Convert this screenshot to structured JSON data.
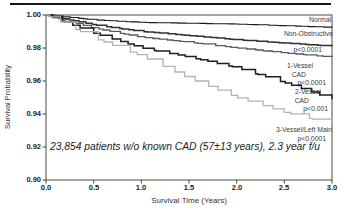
{
  "figure": {
    "annotation": "23,854 patients w/o known CAD (57±13 years), 2.3 year f/u"
  },
  "chart_data": {
    "type": "line",
    "subtype": "kaplan-meier-step-curves",
    "title": "",
    "xlabel": "Survival Time (Years)",
    "ylabel": "Survival Probability",
    "xlim": [
      0.0,
      3.0
    ],
    "ylim": [
      0.9,
      1.0
    ],
    "grid": false,
    "legend_position": "inside-right",
    "x_ticks": [
      "0.0",
      "0.5",
      "1.0",
      "1.5",
      "2.0",
      "2.5",
      "3.0"
    ],
    "y_ticks": [
      "1.00",
      "0.98",
      "0.96",
      "0.94",
      "0.92",
      "0.90"
    ],
    "x": [
      0,
      0.5,
      1.0,
      1.5,
      2.0,
      2.5,
      3.0
    ],
    "series": [
      {
        "id": "normal",
        "name": "Normal",
        "p_value": "",
        "color": "#1b1b1b",
        "width": 1.1,
        "steps": 42,
        "values": [
          1.0,
          0.997,
          0.9955,
          0.995,
          0.9945,
          0.9935,
          0.9925
        ]
      },
      {
        "id": "non-obstructive",
        "name": "Non-Obstructive",
        "p_value": "p<0.0001",
        "color": "#303030",
        "width": 1.5,
        "steps": 46,
        "values": [
          1.0,
          0.994,
          0.99,
          0.9875,
          0.985,
          0.983,
          0.981
        ]
      },
      {
        "id": "1-vessel-cad",
        "name": "1-Vessel CAD",
        "p_value": "p<0.0001",
        "color": "#5a5a5a",
        "width": 1.3,
        "steps": 42,
        "values": [
          1.0,
          0.992,
          0.9865,
          0.9835,
          0.98,
          0.977,
          0.9745
        ]
      },
      {
        "id": "2-vessel-cad",
        "name": "2-Vessel CAD",
        "p_value": "p<0.001",
        "color": "#1e1e1e",
        "width": 1.5,
        "steps": 34,
        "values": [
          1.0,
          0.989,
          0.98,
          0.9745,
          0.968,
          0.959,
          0.949
        ]
      },
      {
        "id": "3-vessel-left-main",
        "name": "3-Vessel/Left Main",
        "p_value": "p<0.0001",
        "color": "#b3b3b3",
        "width": 1.3,
        "steps": 26,
        "values": [
          1.0,
          0.986,
          0.975,
          0.9615,
          0.95,
          0.941,
          0.934
        ]
      }
    ],
    "annotation": "23,854 patients w/o known CAD (57±13 years), 2.3 year f/u"
  },
  "legend_lines": [
    {
      "text": "Normal"
    },
    {
      "text": "Non-Obstructive"
    },
    {
      "text": "p<0.0001"
    },
    {
      "text": "1-Vessel"
    },
    {
      "text": "CAD"
    },
    {
      "text": "p<0.0001"
    },
    {
      "text": "2-Vessel"
    },
    {
      "text": "CAD"
    },
    {
      "text": "p<0.001"
    },
    {
      "text": "3-Vessel/Left Main"
    },
    {
      "text": "p<0.0001"
    }
  ]
}
